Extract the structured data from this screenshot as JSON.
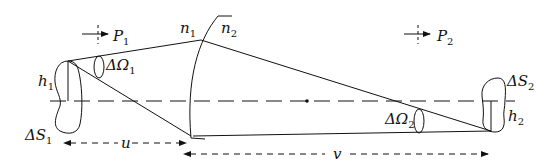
{
  "figure": {
    "labels": {
      "P1": {
        "main": "P",
        "sub": "1"
      },
      "P2": {
        "main": "P",
        "sub": "2"
      },
      "n1": {
        "main": "n",
        "sub": "1"
      },
      "n2": {
        "main": "n",
        "sub": "2"
      },
      "h1": {
        "main": "h",
        "sub": "1"
      },
      "h2": {
        "main": "h",
        "sub": "2"
      },
      "dOmega1": {
        "main": "ΔΩ",
        "sub": "1"
      },
      "dOmega2": {
        "main": "ΔΩ",
        "sub": "2"
      },
      "dS1": {
        "main": "ΔS",
        "sub": "1"
      },
      "dS2": {
        "main": "ΔS",
        "sub": "2"
      },
      "u": "u",
      "v": "v"
    }
  }
}
